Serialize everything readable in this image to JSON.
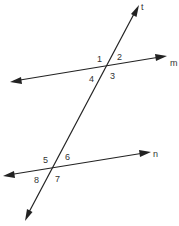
{
  "diagram": {
    "lines": {
      "transversal": {
        "label": "t"
      },
      "upper": {
        "label": "m"
      },
      "lower": {
        "label": "n"
      }
    },
    "angles_upper": [
      "1",
      "2",
      "3",
      "4"
    ],
    "angles_lower": [
      "5",
      "6",
      "7",
      "8"
    ],
    "colors": {
      "stroke": "#222222",
      "text": "#333333",
      "background": "#ffffff"
    }
  }
}
